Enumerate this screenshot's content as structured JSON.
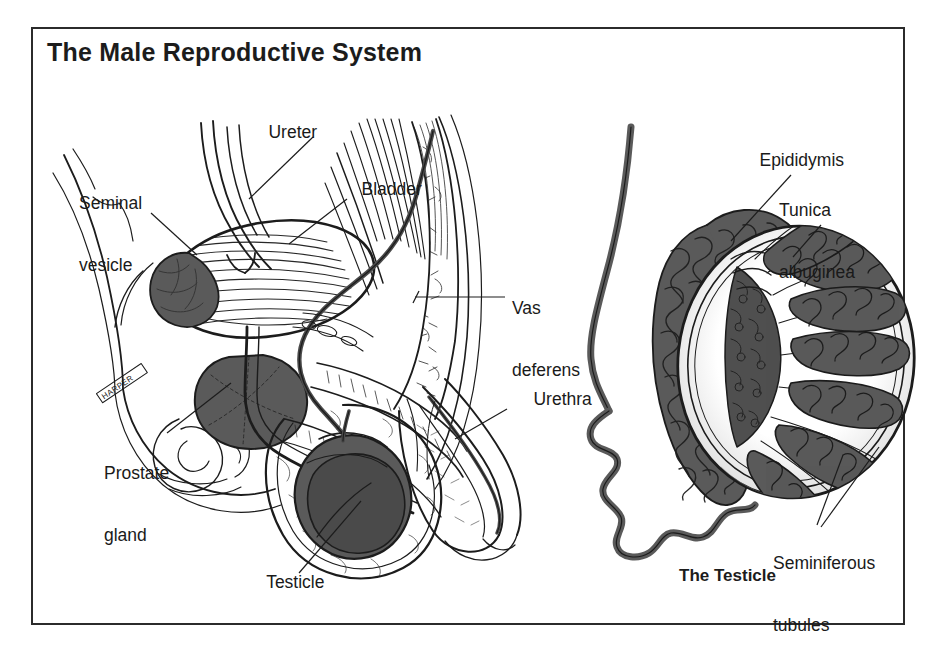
{
  "figure": {
    "title": "The Male Reproductive System",
    "frame_color": "#2b2b2b",
    "background_color": "#ffffff",
    "ink_color": "#1c1c1c",
    "organ_fill_color": "#5a5a5a",
    "organ_fill_dark": "#4a4a4a"
  },
  "left_panel": {
    "name": "sagittal-section-male-pelvis",
    "labels": [
      {
        "id": "ureter",
        "text": "Ureter",
        "lines": [
          "Ureter"
        ],
        "x": 218,
        "y": 101,
        "align": "left"
      },
      {
        "id": "seminal-vesicle",
        "text": "Seminal vesicle",
        "lines": [
          "Seminal",
          "vesicle"
        ],
        "x": 48,
        "y": 152,
        "align": "left"
      },
      {
        "id": "bladder",
        "text": "Bladder",
        "lines": [
          "Bladder"
        ],
        "x": 311,
        "y": 158,
        "align": "left"
      },
      {
        "id": "vas-deferens",
        "text": "Vas deferens",
        "lines": [
          "Vas",
          "deferens"
        ],
        "x": 481,
        "y": 257,
        "align": "left"
      },
      {
        "id": "urethra",
        "text": "Urethra",
        "lines": [
          "Urethra"
        ],
        "x": 483,
        "y": 368,
        "align": "left"
      },
      {
        "id": "prostate-gland",
        "text": "Prostate gland",
        "lines": [
          "Prostate",
          "gland"
        ],
        "x": 73,
        "y": 422,
        "align": "left"
      },
      {
        "id": "testicle",
        "text": "Testicle",
        "lines": [
          "Testicle"
        ],
        "x": 216,
        "y": 551,
        "align": "left"
      }
    ]
  },
  "right_panel": {
    "name": "testicle-cross-section",
    "caption": "The Testicle",
    "caption_x": 679,
    "caption_y": 566,
    "labels": [
      {
        "id": "epididymis",
        "text": "Epididymis",
        "lines": [
          "Epididymis"
        ],
        "x": 740,
        "y": 129,
        "align": "left"
      },
      {
        "id": "tunica-albuginea",
        "text": "Tunica albuginea",
        "lines": [
          "Tunica",
          "albuginea"
        ],
        "x": 779,
        "y": 159,
        "align": "left"
      },
      {
        "id": "seminiferous-tubules",
        "text": "Seminiferous tubules",
        "lines": [
          "Seminiferous",
          "tubules"
        ],
        "x": 773,
        "y": 512,
        "align": "left"
      }
    ]
  }
}
